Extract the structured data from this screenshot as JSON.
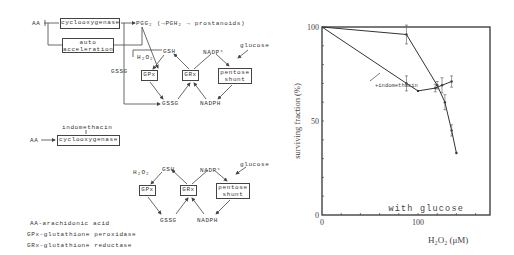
{
  "diagram": {
    "top": {
      "aa": "AA",
      "cyclooxygenase": "cyclooxygenase",
      "pgg2": "PGG₂ (→PGH₂ → prostanoids)",
      "auto_line1": "auto",
      "auto_line2": "acceleration",
      "h2o2": "H₂O₂",
      "gssg_left": "GSSG",
      "gsh": "GSH",
      "nadp": "NADP⁺",
      "glucose": "glucose",
      "gpx": "GPx",
      "grx": "GRx",
      "pentose1": "pentose",
      "pentose2": "shunt",
      "gssg": "GSSG",
      "nadph": "NADPH"
    },
    "middle": {
      "indomethacin": "indomethacin",
      "aa": "AA",
      "cyclooxygenase": "cyclooxygenase"
    },
    "bottom": {
      "h2o2": "H₂O₂",
      "gsh": "GSH",
      "nadp": "NADP⁺",
      "glucose": "glucose",
      "gpx": "GPx",
      "grx": "GRx",
      "pentose1": "pentose",
      "pentose2": "shunt",
      "gssg": "GSSG",
      "nadph": "NADPH"
    },
    "legend": [
      "AA-arachidonic acid",
      "GPx-glutathione peroxidase",
      "GRx-glutathione reductase"
    ]
  },
  "chart_data": {
    "type": "line",
    "title": "",
    "annotation": "with glucose",
    "xlabel": "H₂O₂ (μM)",
    "ylabel": "surviving fraction (%)",
    "xlim": [
      0,
      175
    ],
    "ylim": [
      0,
      100
    ],
    "xticks": [
      0,
      100
    ],
    "yticks": [
      0,
      50,
      100
    ],
    "x_minor_step": 20,
    "y_minor_step": 10,
    "grid": false,
    "series": [
      {
        "name": "control",
        "x": [
          0,
          88,
          120,
          128,
          135,
          140
        ],
        "y": [
          100,
          96,
          69,
          60,
          45,
          33
        ],
        "err": [
          0,
          5,
          2,
          4,
          3,
          0
        ]
      },
      {
        "name": "+indomethacin",
        "x": [
          0,
          88,
          100,
          118,
          125,
          135
        ],
        "y": [
          100,
          70,
          66,
          67.5,
          69,
          71
        ],
        "err": [
          0,
          4,
          0,
          2,
          4,
          3
        ]
      }
    ],
    "series_label": "+indomethacin"
  }
}
